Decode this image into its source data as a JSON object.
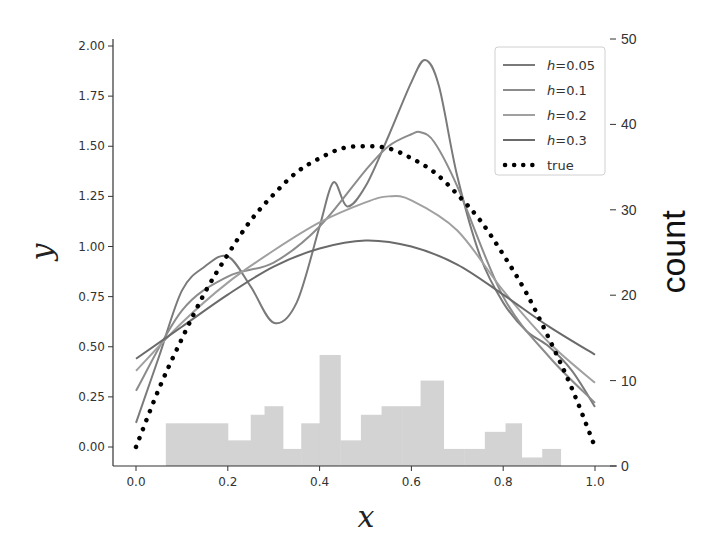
{
  "chart_data": {
    "type": "line",
    "title": "",
    "xlabel": "x",
    "ylabel": "y",
    "y2label": "count",
    "xlim": [
      -0.05,
      1.05
    ],
    "ylim": [
      -0.08,
      2.02
    ],
    "y2lim": [
      0,
      50
    ],
    "xticks": [
      "0.0",
      "0.2",
      "0.4",
      "0.6",
      "0.8",
      "1.0"
    ],
    "yticks": [
      "0.00",
      "0.25",
      "0.50",
      "0.75",
      "1.00",
      "1.25",
      "1.50",
      "1.75",
      "2.00"
    ],
    "y2ticks": [
      "0",
      "10",
      "20",
      "30",
      "40",
      "50"
    ],
    "grid": false,
    "legend_position": "upper right",
    "series": [
      {
        "name": "h=0.05",
        "color": "#7a7a7a",
        "style": "solid",
        "x": [
          0.0,
          0.05,
          0.1,
          0.15,
          0.2,
          0.25,
          0.3,
          0.35,
          0.4,
          0.43,
          0.46,
          0.5,
          0.55,
          0.6,
          0.63,
          0.66,
          0.7,
          0.75,
          0.8,
          0.85,
          0.9,
          0.95,
          1.0
        ],
        "y": [
          0.12,
          0.45,
          0.78,
          0.9,
          0.95,
          0.8,
          0.62,
          0.72,
          1.1,
          1.32,
          1.2,
          1.3,
          1.55,
          1.82,
          1.93,
          1.8,
          1.35,
          0.95,
          0.72,
          0.58,
          0.5,
          0.38,
          0.2
        ]
      },
      {
        "name": "h=0.1",
        "color": "#8c8c8c",
        "style": "solid",
        "x": [
          0.0,
          0.1,
          0.2,
          0.3,
          0.4,
          0.5,
          0.55,
          0.6,
          0.62,
          0.65,
          0.7,
          0.8,
          0.9,
          1.0
        ],
        "y": [
          0.28,
          0.68,
          0.85,
          0.92,
          1.1,
          1.38,
          1.5,
          1.56,
          1.57,
          1.52,
          1.3,
          0.75,
          0.45,
          0.22
        ]
      },
      {
        "name": "h=0.2",
        "color": "#a0a0a0",
        "style": "solid",
        "x": [
          0.0,
          0.1,
          0.2,
          0.3,
          0.4,
          0.5,
          0.55,
          0.6,
          0.7,
          0.8,
          0.9,
          1.0
        ],
        "y": [
          0.38,
          0.62,
          0.82,
          0.98,
          1.12,
          1.22,
          1.25,
          1.23,
          1.08,
          0.78,
          0.52,
          0.32
        ]
      },
      {
        "name": "h=0.3",
        "color": "#6a6a6a",
        "style": "solid",
        "x": [
          0.0,
          0.1,
          0.2,
          0.3,
          0.4,
          0.5,
          0.6,
          0.7,
          0.8,
          0.9,
          1.0
        ],
        "y": [
          0.44,
          0.6,
          0.76,
          0.9,
          0.99,
          1.03,
          1.0,
          0.91,
          0.76,
          0.6,
          0.46
        ]
      },
      {
        "name": "true",
        "color": "#000000",
        "style": "dotted",
        "x": [
          0.0,
          0.05,
          0.1,
          0.15,
          0.2,
          0.25,
          0.3,
          0.35,
          0.4,
          0.45,
          0.5,
          0.55,
          0.6,
          0.65,
          0.7,
          0.75,
          0.8,
          0.85,
          0.9,
          0.95,
          1.0
        ],
        "y": [
          0.0,
          0.29,
          0.54,
          0.77,
          0.96,
          1.13,
          1.26,
          1.37,
          1.44,
          1.49,
          1.5,
          1.49,
          1.44,
          1.37,
          1.26,
          1.13,
          0.96,
          0.77,
          0.54,
          0.29,
          0.0
        ]
      }
    ],
    "histogram": {
      "color": "#d3d3d3",
      "bin_edges": [
        0.065,
        0.1,
        0.15,
        0.2,
        0.25,
        0.28,
        0.32,
        0.36,
        0.4,
        0.445,
        0.49,
        0.535,
        0.58,
        0.62,
        0.67,
        0.715,
        0.76,
        0.805,
        0.84,
        0.885,
        0.925,
        0.97
      ],
      "counts": [
        5,
        5,
        5,
        3,
        6,
        7,
        2,
        5,
        13,
        3,
        6,
        7,
        7,
        10,
        2,
        2,
        4,
        5,
        1,
        2,
        0
      ]
    }
  },
  "legend": {
    "items": [
      {
        "italic": "h",
        "rest": "=0.05"
      },
      {
        "italic": "h",
        "rest": "=0.1"
      },
      {
        "italic": "h",
        "rest": "=0.2"
      },
      {
        "italic": "h",
        "rest": "=0.3"
      },
      {
        "italic": "",
        "rest": "true"
      }
    ]
  },
  "axes": {
    "x_label": "x",
    "y_label": "y",
    "y2_label": "count"
  }
}
